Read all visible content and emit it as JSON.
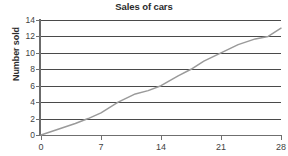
{
  "chart_data": {
    "type": "line",
    "title": "Sales of cars",
    "xlabel": "",
    "ylabel": "Number sold",
    "xlim": [
      0,
      28
    ],
    "ylim": [
      0,
      14
    ],
    "grid": true,
    "grid_axis": "y",
    "legend": false,
    "legend_position": "none",
    "line_color": "#9a9a9a",
    "grid_color": "#4a4a4a",
    "axis_color": "#6f6f6f",
    "x_ticks": [
      0,
      7,
      14,
      21,
      28
    ],
    "x_tick_labels": [
      "0",
      "7",
      "14",
      "21",
      "28"
    ],
    "y_ticks": [
      0,
      2,
      4,
      6,
      8,
      10,
      12,
      14
    ],
    "y_tick_labels": [
      "0",
      "2",
      "4",
      "6",
      "8",
      "10",
      "12",
      "14"
    ],
    "series": [
      {
        "name": "Sales of cars",
        "x": [
          0,
          2,
          4,
          5.5,
          7,
          9,
          11,
          12.5,
          14,
          16,
          17.5,
          19,
          21,
          23,
          25,
          26.5,
          28
        ],
        "values": [
          0,
          0.7,
          1.4,
          2.0,
          2.7,
          4.0,
          5.0,
          5.4,
          6.0,
          7.2,
          8.0,
          9.0,
          10.0,
          11.0,
          11.7,
          12.0,
          13.0
        ]
      }
    ]
  },
  "axes": {
    "title": "Sales of cars",
    "y_title": "Number sold"
  }
}
